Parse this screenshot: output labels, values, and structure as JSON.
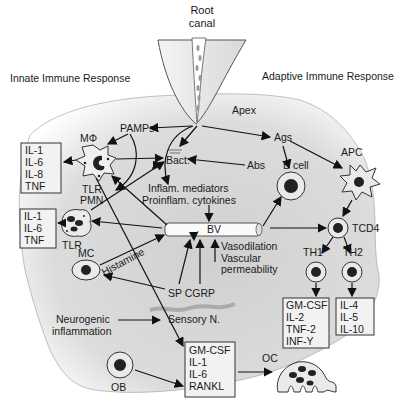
{
  "headings": {
    "root_canal_line1": "Root",
    "root_canal_line2": "canal",
    "innate": "Innate Immune Response",
    "adaptive": "Adaptive Immune Response",
    "apex": "Apex"
  },
  "nodes": {
    "pamps": "PAMPs",
    "macrophage": "MΦ",
    "tlr1": "TLR",
    "pmn": "PMN",
    "tlr2": "TLR",
    "mc": "MC",
    "histamine": "Histamine",
    "bact": "Bact.",
    "abs": "Abs",
    "ags": "Ags",
    "bcell": "B cell",
    "apc": "APC",
    "inflam_line1": "Inflam. mediators",
    "inflam_line2": "Proinflam. cytokines",
    "bv": "BV",
    "vaso_line1": "Vasodilation",
    "vaso_line2": "Vascular",
    "vaso_line3": "permeability",
    "tcd4": "TCD4",
    "th1": "TH1",
    "th2": "TH2",
    "spcgrp": "SP CGRP",
    "sensory": "Sensory N.",
    "neuro_line1": "Neurogenic",
    "neuro_line2": "inflammation",
    "ob": "OB",
    "oc": "OC"
  },
  "boxes": {
    "macrophage_cytokines": [
      "IL-1",
      "IL-6",
      "IL-8",
      "TNF"
    ],
    "pmn_cytokines": [
      "IL-1",
      "IL-6",
      "TNF"
    ],
    "th1_cytokines": [
      "GM-CSF",
      "IL-2",
      "TNF-2",
      "INF-Y"
    ],
    "th2_cytokines": [
      "IL-4",
      "IL-5",
      "IL-10"
    ],
    "bone_cytokines": [
      "GM-CSF",
      "IL-1",
      "IL-6",
      "RANKL"
    ]
  },
  "colors": {
    "tissue_fill": "#dcdcdc",
    "tissue_edge": "#ffffff",
    "tooth": "#e8e8e8",
    "nucleus": "#222222"
  }
}
